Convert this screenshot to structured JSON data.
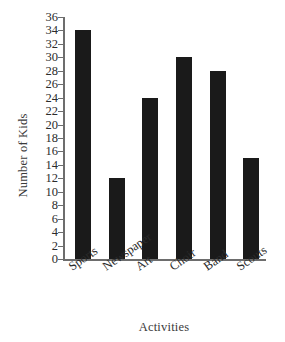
{
  "chart_data": {
    "type": "bar",
    "title": "",
    "categories": [
      "Sports",
      "Newspaper",
      "Art",
      "Choir",
      "Band",
      "Scouts"
    ],
    "values": [
      34,
      12,
      24,
      30,
      28,
      15
    ],
    "xlabel": "Activities",
    "ylabel": "Number of Kids",
    "ylim": [
      0,
      36
    ],
    "ytick_step": 2,
    "yticks": [
      0,
      2,
      4,
      6,
      8,
      10,
      12,
      14,
      16,
      18,
      20,
      22,
      24,
      26,
      28,
      30,
      32,
      34,
      36
    ],
    "grid": false,
    "legend": null,
    "bar_color": "#1a1a1a",
    "axis_color": "#6d6d6d",
    "background_color": "#ffffff",
    "xtick_label_rotation": -35
  }
}
